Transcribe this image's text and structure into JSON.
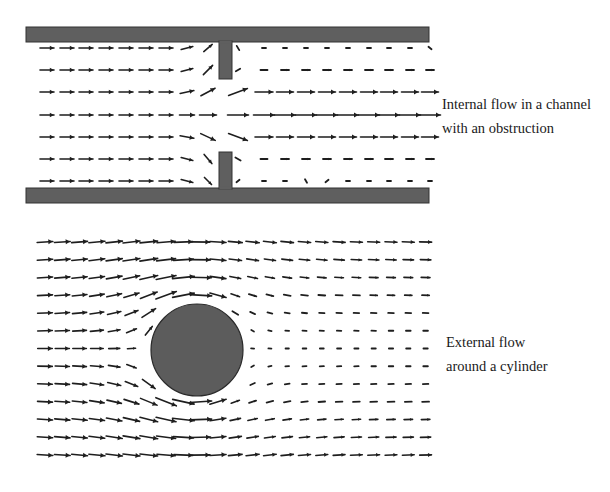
{
  "panels": [
    {
      "id": "internal",
      "caption": [
        "Internal flow in a channel",
        "with an obstruction"
      ],
      "caption_pos": {
        "x": 442,
        "y": 92
      },
      "channel": {
        "x0": 26,
        "x1": 429,
        "top_wall": [
          27,
          42
        ],
        "bottom_wall": [
          188,
          203
        ]
      },
      "obstruction": {
        "x0": 219,
        "x1": 232,
        "top_to": 79,
        "bottom_from": 152
      },
      "grid": {
        "rows_y": [
          48,
          70,
          92,
          115,
          137,
          159,
          181
        ],
        "left_cols_x": [
          47,
          67,
          86,
          106,
          126,
          146,
          166,
          187,
          208
        ],
        "right_cols_x": [
          238,
          264,
          285,
          306,
          327,
          348,
          369,
          389,
          410,
          430
        ]
      },
      "vectors_left": [
        [
          [
            0,
            14
          ],
          [
            0,
            14
          ],
          [
            0,
            14
          ],
          [
            0,
            14
          ],
          [
            0,
            14
          ],
          [
            0,
            14
          ],
          [
            0,
            14
          ],
          [
            15,
            12
          ],
          [
            40,
            11
          ]
        ],
        [
          [
            0,
            14
          ],
          [
            0,
            14
          ],
          [
            0,
            14
          ],
          [
            0,
            14
          ],
          [
            0,
            14
          ],
          [
            0,
            14
          ],
          [
            0,
            14
          ],
          [
            15,
            12
          ],
          [
            45,
            13
          ]
        ],
        [
          [
            0,
            14
          ],
          [
            0,
            14
          ],
          [
            0,
            14
          ],
          [
            0,
            14
          ],
          [
            0,
            14
          ],
          [
            0,
            14
          ],
          [
            0,
            14
          ],
          [
            12,
            14
          ],
          [
            28,
            16
          ]
        ],
        [
          [
            0,
            14
          ],
          [
            0,
            14
          ],
          [
            0,
            14
          ],
          [
            0,
            14
          ],
          [
            0,
            14
          ],
          [
            0,
            14
          ],
          [
            0,
            14
          ],
          [
            0,
            15
          ],
          [
            0,
            17
          ]
        ],
        [
          [
            0,
            14
          ],
          [
            0,
            14
          ],
          [
            0,
            14
          ],
          [
            0,
            14
          ],
          [
            0,
            14
          ],
          [
            0,
            14
          ],
          [
            0,
            14
          ],
          [
            -10,
            14
          ],
          [
            -25,
            16
          ]
        ],
        [
          [
            0,
            14
          ],
          [
            0,
            14
          ],
          [
            0,
            14
          ],
          [
            0,
            14
          ],
          [
            0,
            14
          ],
          [
            0,
            14
          ],
          [
            0,
            14
          ],
          [
            -15,
            12
          ],
          [
            -50,
            12
          ]
        ],
        [
          [
            0,
            14
          ],
          [
            0,
            14
          ],
          [
            0,
            14
          ],
          [
            0,
            14
          ],
          [
            0,
            14
          ],
          [
            0,
            14
          ],
          [
            0,
            14
          ],
          [
            -15,
            12
          ],
          [
            -45,
            10
          ]
        ]
      ],
      "vectors_right": [
        [
          [
            -60,
            5
          ],
          [
            0,
            4
          ],
          [
            0,
            4
          ],
          [
            0,
            4
          ],
          [
            0,
            4
          ],
          [
            0,
            4
          ],
          [
            0,
            4
          ],
          [
            0,
            4
          ],
          [
            0,
            4
          ],
          [
            -40,
            4
          ]
        ],
        [
          [
            30,
            5
          ],
          [
            0,
            7
          ],
          [
            0,
            8
          ],
          [
            0,
            8
          ],
          [
            0,
            8
          ],
          [
            0,
            8
          ],
          [
            0,
            8
          ],
          [
            0,
            8
          ],
          [
            0,
            8
          ],
          [
            0,
            8
          ]
        ],
        [
          [
            20,
            20
          ],
          [
            0,
            18
          ],
          [
            0,
            17
          ],
          [
            0,
            17
          ],
          [
            0,
            17
          ],
          [
            0,
            17
          ],
          [
            0,
            17
          ],
          [
            0,
            17
          ],
          [
            0,
            17
          ],
          [
            0,
            17
          ]
        ],
        [
          [
            0,
            21
          ],
          [
            0,
            21
          ],
          [
            0,
            21
          ],
          [
            0,
            21
          ],
          [
            0,
            21
          ],
          [
            0,
            21
          ],
          [
            0,
            21
          ],
          [
            0,
            21
          ],
          [
            0,
            21
          ],
          [
            0,
            21
          ]
        ],
        [
          [
            -20,
            20
          ],
          [
            0,
            18
          ],
          [
            0,
            17
          ],
          [
            0,
            17
          ],
          [
            0,
            17
          ],
          [
            0,
            17
          ],
          [
            0,
            17
          ],
          [
            0,
            17
          ],
          [
            0,
            17
          ],
          [
            0,
            17
          ]
        ],
        [
          [
            -30,
            6
          ],
          [
            0,
            7
          ],
          [
            0,
            8
          ],
          [
            0,
            8
          ],
          [
            0,
            8
          ],
          [
            0,
            8
          ],
          [
            0,
            8
          ],
          [
            0,
            8
          ],
          [
            0,
            8
          ],
          [
            0,
            8
          ]
        ],
        [
          [
            40,
            4
          ],
          [
            0,
            4
          ],
          [
            0,
            4
          ],
          [
            -60,
            4
          ],
          [
            40,
            4
          ],
          [
            0,
            4
          ],
          [
            0,
            4
          ],
          [
            0,
            4
          ],
          [
            0,
            4
          ],
          [
            0,
            4
          ]
        ]
      ],
      "wall_color": "#5f5f5f",
      "wall_edge_color": "#333333"
    },
    {
      "id": "external",
      "caption": [
        "External flow",
        "around a cylinder"
      ],
      "caption_pos": {
        "x": 446,
        "y": 330
      },
      "cylinder": {
        "cx": 197,
        "cy": 350,
        "r": 46
      },
      "grid": {
        "x0": 45,
        "dx": 17.3,
        "cols": 23,
        "y0": 242,
        "dy": 17.75,
        "rows": 13
      },
      "model": {
        "type": "potential-flow-with-wake",
        "U": 1.0,
        "arrow_scale": 16,
        "max_len": 22,
        "min_len": 3
      },
      "fill_color": "#5c5c5c",
      "edge_color": "#2a2a2a"
    }
  ],
  "colors": {
    "arrow": "#1e1e1e",
    "background": "#ffffff"
  }
}
